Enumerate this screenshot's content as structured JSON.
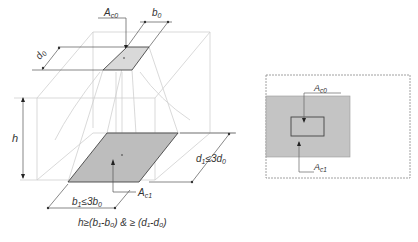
{
  "left_figure": {
    "labels": {
      "ac0": "A",
      "ac0_sub": "c0",
      "ac1": "A",
      "ac1_sub": "c1",
      "b0": "b",
      "b0_sub": "0",
      "d0": "d",
      "d0_sub": "0",
      "h": "h",
      "b1_constraint": "b",
      "b1_constraint_sub": "1",
      "b1_constraint_rest": "≤3b",
      "b1_constraint_sub2": "0",
      "d1_constraint": "d",
      "d1_constraint_sub": "1",
      "d1_constraint_rest": "≤3d",
      "d1_constraint_sub2": "0",
      "h_condition": "h≥(b₁-b₀) & ≥ (d₁-d₀)"
    },
    "colors": {
      "top_area_fill": "#d9d9d9",
      "bottom_area_fill": "#bdbdbd",
      "outline": "#444444",
      "construction_lines": "#c8c8c8"
    }
  },
  "right_figure": {
    "labels": {
      "ac0": "A",
      "ac0_sub": "c0",
      "ac1": "A",
      "ac1_sub": "c1"
    },
    "colors": {
      "outer_border": "#888888",
      "ac1_fill": "#c4c4c4",
      "ac0_outline": "#444444"
    }
  }
}
